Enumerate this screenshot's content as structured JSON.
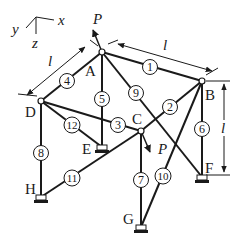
{
  "diagram": {
    "axes": {
      "x": "x",
      "y": "y",
      "z": "z"
    },
    "dimension_label": "l",
    "load_label": "P",
    "nodes": [
      {
        "id": "A",
        "label": "A",
        "x": 102,
        "y": 52,
        "support": false
      },
      {
        "id": "B",
        "label": "B",
        "x": 202,
        "y": 81,
        "support": false
      },
      {
        "id": "C",
        "label": "C",
        "x": 141,
        "y": 131,
        "support": false
      },
      {
        "id": "D",
        "label": "D",
        "x": 41,
        "y": 101,
        "support": false
      },
      {
        "id": "E",
        "label": "E",
        "x": 102,
        "y": 147,
        "support": true
      },
      {
        "id": "F",
        "label": "F",
        "x": 202,
        "y": 177,
        "support": true
      },
      {
        "id": "G",
        "label": "G",
        "x": 141,
        "y": 227,
        "support": true
      },
      {
        "id": "H",
        "label": "H",
        "x": 41,
        "y": 197,
        "support": true
      }
    ],
    "members": [
      {
        "num": "1",
        "from": "A",
        "to": "B"
      },
      {
        "num": "2",
        "from": "B",
        "to": "C"
      },
      {
        "num": "3",
        "from": "D",
        "to": "C"
      },
      {
        "num": "4",
        "from": "A",
        "to": "D"
      },
      {
        "num": "5",
        "from": "A",
        "to": "E"
      },
      {
        "num": "6",
        "from": "B",
        "to": "F"
      },
      {
        "num": "7",
        "from": "C",
        "to": "G"
      },
      {
        "num": "8",
        "from": "D",
        "to": "H"
      },
      {
        "num": "9",
        "from": "A",
        "to": "F"
      },
      {
        "num": "10",
        "from": "B",
        "to": "G"
      },
      {
        "num": "11",
        "from": "H",
        "to": "C"
      },
      {
        "num": "12",
        "from": "D",
        "to": "E"
      }
    ],
    "loads": [
      {
        "node": "A",
        "label": "P",
        "direction": "up-left"
      },
      {
        "node": "C",
        "label": "P",
        "direction": "down-right"
      }
    ],
    "dimensions": [
      {
        "label": "l",
        "between": "A-D",
        "orientation": "diagonal"
      },
      {
        "label": "l",
        "between": "A-B",
        "orientation": "diagonal"
      },
      {
        "label": "l",
        "between": "B-F",
        "orientation": "vertical"
      }
    ]
  }
}
